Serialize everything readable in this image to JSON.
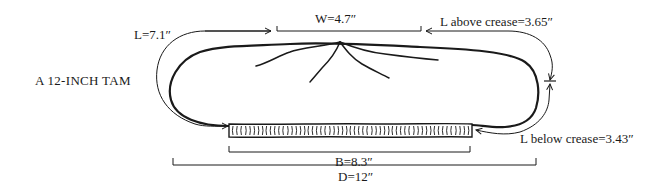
{
  "diagram": {
    "title": "A 12-INCH TAM",
    "measurements": {
      "length_top": {
        "label": "L=7.1″",
        "value_in": 7.1
      },
      "width": {
        "label": "W=4.7″",
        "value_in": 4.7
      },
      "length_above_crease": {
        "label": "L above crease=3.65″",
        "value_in": 3.65
      },
      "length_below_crease": {
        "label": "L below crease=3.43″",
        "value_in": 3.43
      },
      "band": {
        "label": "B=8.3″",
        "value_in": 8.3
      },
      "diameter": {
        "label": "D=12″",
        "value_in": 12
      }
    },
    "colors": {
      "ink": "#1a1a1a",
      "background": "#ffffff"
    }
  }
}
